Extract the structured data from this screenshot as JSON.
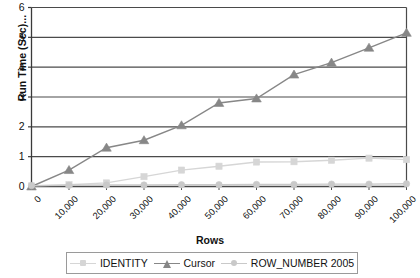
{
  "chart_data": {
    "type": "line",
    "title": "",
    "xlabel": "Rows",
    "ylabel": "Run Time (Sec)...",
    "x": [
      0,
      10000,
      20000,
      30000,
      40000,
      50000,
      60000,
      70000,
      80000,
      90000,
      100000
    ],
    "xticklabels": [
      "0",
      "10,000",
      "20,000",
      "30,000",
      "40,000",
      "50,000",
      "60,000",
      "70,000",
      "80,000",
      "90,000",
      "100,000"
    ],
    "yticklabels": [
      "0",
      "1",
      "2",
      "3",
      "4",
      "5",
      "6"
    ],
    "xlim": [
      0,
      100000
    ],
    "ylim": [
      0,
      6
    ],
    "grid": "horizontal",
    "legend_position": "bottom",
    "series": [
      {
        "name": "IDENTITY",
        "color": "#d6d6d6",
        "marker": "square",
        "values": [
          0.02,
          0.06,
          0.12,
          0.33,
          0.55,
          0.68,
          0.82,
          0.83,
          0.88,
          0.95,
          0.9
        ]
      },
      {
        "name": "Cursor",
        "color": "#878787",
        "marker": "triangle",
        "values": [
          0.0,
          0.55,
          1.3,
          1.55,
          2.05,
          2.8,
          2.95,
          3.75,
          4.15,
          4.65,
          5.15
        ]
      },
      {
        "name": "ROW_NUMBER 2005",
        "color": "#c9c9c9",
        "marker": "circle",
        "values": [
          0.03,
          0.04,
          0.05,
          0.05,
          0.06,
          0.06,
          0.07,
          0.07,
          0.08,
          0.08,
          0.09
        ]
      }
    ]
  },
  "legend": {
    "items": [
      {
        "label": "IDENTITY"
      },
      {
        "label": "Cursor"
      },
      {
        "label": "ROW_NUMBER 2005"
      }
    ]
  }
}
